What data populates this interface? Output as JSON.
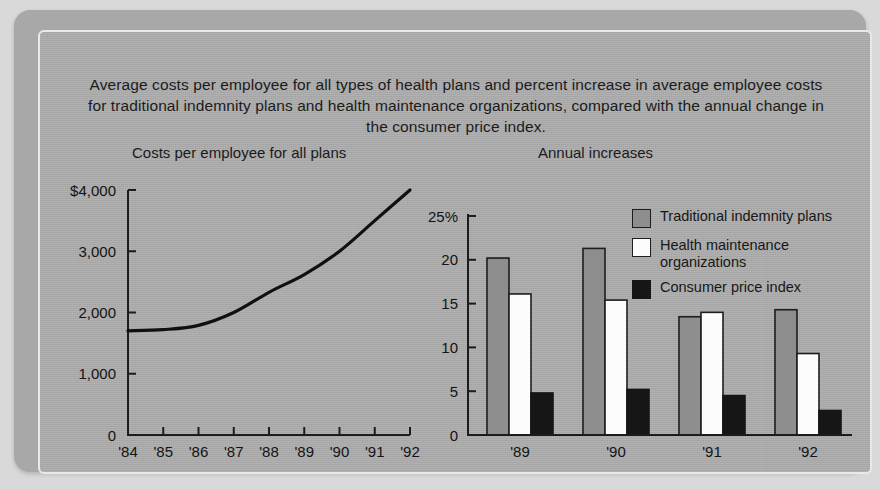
{
  "caption": "Average costs per employee for all types of health plans and percent increase in average employee costs for traditional indemnity plans and health maintenance organizations, compared with the annual change in the consumer price index.",
  "legend": {
    "items": [
      {
        "label": "Traditional indemnity plans",
        "swatch": "medium-gray",
        "color": "#8e8e8e"
      },
      {
        "label": "Health maintenance organizations",
        "swatch": "white",
        "color": "#fcfcfc"
      },
      {
        "label": "Consumer price index",
        "swatch": "black",
        "color": "#161616"
      }
    ]
  },
  "chart_data": [
    {
      "type": "line",
      "title": "Costs per employee for all plans",
      "xlabel": "",
      "ylabel": "",
      "x": [
        "'84",
        "'85",
        "'86",
        "'87",
        "'88",
        "'89",
        "'90",
        "'91",
        "'92"
      ],
      "values": [
        1700,
        1720,
        1790,
        2000,
        2330,
        2620,
        3000,
        3500,
        4000
      ],
      "ytick_labels": [
        "$4,000",
        "3,000",
        "2,000",
        "1,000",
        "0"
      ],
      "ytick_values": [
        4000,
        3000,
        2000,
        1000,
        0
      ],
      "ylim": [
        0,
        4000
      ],
      "grid": false,
      "legend_position": "none",
      "currency": "$"
    },
    {
      "type": "bar",
      "title": "Annual increases",
      "xlabel": "",
      "ylabel": "",
      "categories": [
        "'89",
        "'90",
        "'91",
        "'92"
      ],
      "series": [
        {
          "name": "Traditional indemnity plans",
          "values": [
            20.2,
            21.3,
            13.5,
            14.3
          ]
        },
        {
          "name": "Health maintenance organizations",
          "values": [
            16.1,
            15.4,
            14.0,
            9.3
          ]
        },
        {
          "name": "Consumer price index",
          "values": [
            4.8,
            5.2,
            4.5,
            2.8
          ]
        }
      ],
      "ytick_labels": [
        "25%",
        "20",
        "15",
        "10",
        "5",
        "0"
      ],
      "ytick_values": [
        25,
        20,
        15,
        10,
        5,
        0
      ],
      "ylim": [
        0,
        25
      ],
      "unit": "%",
      "grid": false,
      "legend_position": "top-right"
    }
  ]
}
